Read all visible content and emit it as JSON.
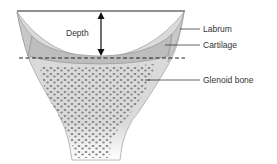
{
  "diagram": {
    "labels": {
      "depth": "Depth",
      "labrum": "Labrum",
      "cartilage": "Cartilage",
      "glenoid_bone": "Glenoid bone"
    },
    "colors": {
      "bone_fill": "#dcdcdc",
      "trabecular_dots": "#6e6e6e",
      "labrum_fill": "#c8c8c8",
      "cartilage_fill": "#bdbdbd",
      "lines": "#222222"
    }
  }
}
